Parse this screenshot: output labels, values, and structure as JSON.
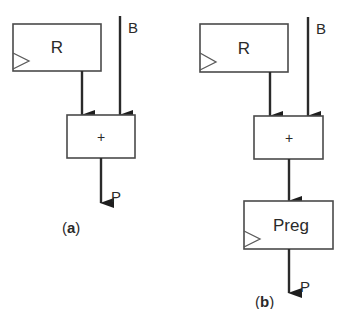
{
  "diagram": {
    "type": "register-transfer block diagram",
    "colors": {
      "stroke": "#4a4a4a",
      "wire": "#2a2a2a",
      "background": "#ffffff"
    },
    "panel_a": {
      "caption_open": "(",
      "caption_letter": "a",
      "caption_close": ")",
      "register_label": "R",
      "input_label": "B",
      "adder_label": "+",
      "output_label": "P"
    },
    "panel_b": {
      "caption_open": "(",
      "caption_letter": "b",
      "caption_close": ")",
      "register_label": "R",
      "input_label": "B",
      "adder_label": "+",
      "output_register_label": "Preg",
      "output_label": "P"
    }
  }
}
